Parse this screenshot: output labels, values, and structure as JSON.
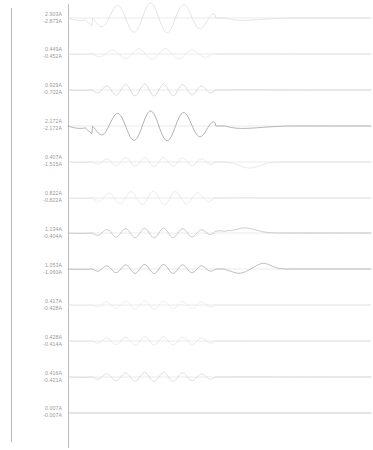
{
  "view": {
    "title": "Transient Simulation Waveform Viewer",
    "background_color": "#ffffff",
    "frame_color": "#b9b9b9",
    "axis_color": "#bdbdbd",
    "zero_line_color": "#d7d7d7"
  },
  "chart_data": {
    "type": "line",
    "title": "",
    "subtitle": "",
    "xlabel": "",
    "ylabel": "",
    "grid": false,
    "legend_position": "none",
    "units": "A",
    "panel_count": 12,
    "x": [
      0,
      1
    ],
    "shared_x_axis": true,
    "series": [
      {
        "name": "trace-1",
        "index": 1,
        "max_label": "2.903A",
        "min_label": "-2.873A",
        "max": 2.903,
        "min": -2.873,
        "color": "#d8d8d8",
        "cycles": 4,
        "amplitude_ratio": 1.0,
        "shape": "large-oscillation-burst",
        "damped_tail": true
      },
      {
        "name": "trace-2",
        "index": 2,
        "max_label": "0.449A",
        "min_label": "-0.452A",
        "max": 0.449,
        "min": -0.452,
        "color": "#dedede",
        "cycles": 5,
        "amplitude_ratio": 0.35,
        "shape": "small-ripple",
        "damped_tail": true
      },
      {
        "name": "trace-3",
        "index": 3,
        "max_label": "0.929A",
        "min_label": "-0.702A",
        "max": 0.929,
        "min": -0.702,
        "color": "#c4c4c4",
        "cycles": 7,
        "amplitude_ratio": 0.4,
        "shape": "high-frequency-ripple-with-dip",
        "damped_tail": true
      },
      {
        "name": "trace-4",
        "index": 4,
        "max_label": "2.172A",
        "min_label": "-2.172A",
        "max": 2.172,
        "min": -2.172,
        "color": "#8f8f8f",
        "cycles": 4,
        "amplitude_ratio": 1.0,
        "shape": "large-oscillation-burst",
        "damped_tail": true
      },
      {
        "name": "trace-5",
        "index": 5,
        "max_label": "0.407A",
        "min_label": "-1.515A",
        "max": 0.407,
        "min": -1.515,
        "color": "#d9d9d9",
        "cycles": 7,
        "amplitude_ratio": 0.3,
        "shape": "ripple-with-negative-excursion",
        "damped_tail": true
      },
      {
        "name": "trace-6",
        "index": 6,
        "max_label": "0.822A",
        "min_label": "-0.822A",
        "max": 0.822,
        "min": -0.822,
        "color": "#dcdcdc",
        "cycles": 6,
        "amplitude_ratio": 0.45,
        "shape": "small-ripple",
        "damped_tail": true
      },
      {
        "name": "trace-7",
        "index": 7,
        "max_label": "1.134A",
        "min_label": "-0.404A",
        "max": 1.134,
        "min": -0.404,
        "color": "#a8a8a8",
        "cycles": 7,
        "amplitude_ratio": 0.32,
        "shape": "ripple-with-positive-bump",
        "damped_tail": true
      },
      {
        "name": "trace-8",
        "index": 8,
        "max_label": "1.053A",
        "min_label": "-1.060A",
        "max": 1.053,
        "min": -1.06,
        "color": "#8f8f8f",
        "cycles": 7,
        "amplitude_ratio": 0.3,
        "shape": "ripple-with-swing",
        "damped_tail": true
      },
      {
        "name": "trace-9",
        "index": 9,
        "max_label": "0.417A",
        "min_label": "-0.428A",
        "max": 0.417,
        "min": -0.428,
        "color": "#e2e2e2",
        "cycles": 7,
        "amplitude_ratio": 0.28,
        "shape": "small-ripple",
        "damped_tail": true
      },
      {
        "name": "trace-10",
        "index": 10,
        "max_label": "0.428A",
        "min_label": "-0.414A",
        "max": 0.428,
        "min": -0.414,
        "color": "#dadada",
        "cycles": 7,
        "amplitude_ratio": 0.28,
        "shape": "small-ripple",
        "damped_tail": true
      },
      {
        "name": "trace-11",
        "index": 11,
        "max_label": "0.416A",
        "min_label": "-0.421A",
        "max": 0.416,
        "min": -0.421,
        "color": "#c9c9c9",
        "cycles": 7,
        "amplitude_ratio": 0.3,
        "shape": "small-ripple",
        "damped_tail": true
      },
      {
        "name": "trace-12",
        "index": 12,
        "max_label": "0.007A",
        "min_label": "-0.007A",
        "max": 0.007,
        "min": -0.007,
        "color": "#bcbcbc",
        "cycles": 0,
        "amplitude_ratio": 0.0,
        "shape": "flat",
        "damped_tail": true
      }
    ]
  }
}
